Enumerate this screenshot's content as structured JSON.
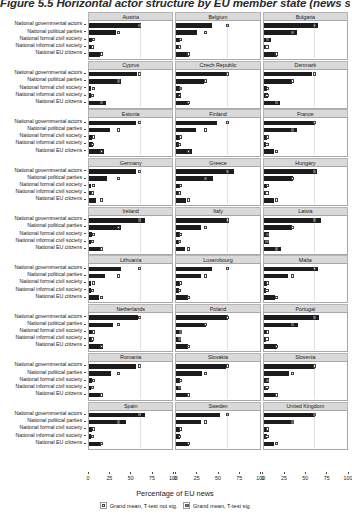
{
  "title": "Figure 5.5 Horizontal actor structure by EU member state (news stories)",
  "axis": {
    "xlabel": "Percentage of EU news",
    "xticks": [
      0,
      25,
      50,
      75,
      100
    ],
    "xlim": [
      0,
      100
    ],
    "categories": [
      "National governmental actors",
      "National political parties",
      "National formal civil society",
      "National informal civil society",
      "National EU citizens"
    ]
  },
  "legend": {
    "items": [
      {
        "label": "Grand mean, T-test not sig.",
        "marker": "open-square"
      },
      {
        "label": "Grand mean, T-test sig",
        "marker": "filled-square"
      }
    ]
  },
  "chart_data": {
    "type": "bar",
    "title": "Figure 5.5 Horizontal actor structure by EU member state (news stories)",
    "xlabel": "Percentage of EU news",
    "ylabel": "",
    "xlim": [
      0,
      100
    ],
    "grid": false,
    "legend_position": "bottom",
    "orientation": "horizontal",
    "categories": [
      "National governmental actors",
      "National political parties",
      "National formal civil society",
      "National informal civil society",
      "National EU citizens"
    ],
    "panels": [
      {
        "name": "Austria",
        "values": [
          63,
          33,
          4,
          3,
          13
        ],
        "grand_mean": [
          61,
          35,
          5,
          4,
          15
        ],
        "sig": [
          true,
          false,
          false,
          false,
          false
        ]
      },
      {
        "name": "Belgium",
        "values": [
          43,
          25,
          5,
          3,
          15
        ],
        "grand_mean": [
          61,
          35,
          5,
          4,
          15
        ],
        "sig": [
          false,
          false,
          false,
          false,
          false
        ]
      },
      {
        "name": "Bulgaria",
        "values": [
          65,
          40,
          9,
          3,
          16
        ],
        "grand_mean": [
          61,
          35,
          5,
          4,
          15
        ],
        "sig": [
          false,
          true,
          true,
          false,
          false
        ]
      },
      {
        "name": "Cyprus",
        "values": [
          58,
          38,
          3,
          2,
          20
        ],
        "grand_mean": [
          61,
          35,
          5,
          4,
          15
        ],
        "sig": [
          false,
          true,
          false,
          false,
          true
        ]
      },
      {
        "name": "Czech Republic",
        "values": [
          61,
          33,
          4,
          6,
          15
        ],
        "grand_mean": [
          61,
          35,
          5,
          4,
          15
        ],
        "sig": [
          false,
          false,
          true,
          false,
          false
        ]
      },
      {
        "name": "Denmark",
        "values": [
          58,
          34,
          4,
          5,
          20
        ],
        "grand_mean": [
          61,
          35,
          5,
          4,
          15
        ],
        "sig": [
          false,
          false,
          false,
          false,
          true
        ]
      },
      {
        "name": "Estonia",
        "values": [
          56,
          25,
          4,
          5,
          18
        ],
        "grand_mean": [
          61,
          35,
          5,
          4,
          15
        ],
        "sig": [
          false,
          false,
          false,
          false,
          false
        ]
      },
      {
        "name": "Finland",
        "values": [
          49,
          24,
          4,
          3,
          19
        ],
        "grand_mean": [
          61,
          35,
          5,
          4,
          15
        ],
        "sig": [
          false,
          false,
          false,
          false,
          false
        ]
      },
      {
        "name": "France",
        "values": [
          62,
          40,
          4,
          3,
          12
        ],
        "grand_mean": [
          61,
          35,
          5,
          4,
          15
        ],
        "sig": [
          false,
          true,
          false,
          false,
          false
        ]
      },
      {
        "name": "Germany",
        "values": [
          56,
          22,
          3,
          3,
          9
        ],
        "grand_mean": [
          61,
          35,
          5,
          4,
          15
        ],
        "sig": [
          false,
          false,
          false,
          false,
          false
        ]
      },
      {
        "name": "Greece",
        "values": [
          69,
          44,
          4,
          3,
          12
        ],
        "grand_mean": [
          61,
          35,
          5,
          4,
          15
        ],
        "sig": [
          true,
          true,
          false,
          false,
          false
        ]
      },
      {
        "name": "Hungary",
        "values": [
          64,
          35,
          4,
          3,
          13
        ],
        "grand_mean": [
          61,
          35,
          5,
          4,
          15
        ],
        "sig": [
          true,
          false,
          false,
          false,
          false
        ]
      },
      {
        "name": "Ireland",
        "values": [
          67,
          38,
          4,
          3,
          13
        ],
        "grand_mean": [
          61,
          35,
          5,
          4,
          15
        ],
        "sig": [
          true,
          false,
          false,
          false,
          false
        ]
      },
      {
        "name": "Italy",
        "values": [
          63,
          30,
          4,
          3,
          10
        ],
        "grand_mean": [
          61,
          35,
          5,
          4,
          15
        ],
        "sig": [
          false,
          false,
          false,
          false,
          false
        ]
      },
      {
        "name": "Latvia",
        "values": [
          69,
          34,
          7,
          6,
          21
        ],
        "grand_mean": [
          61,
          35,
          5,
          4,
          15
        ],
        "sig": [
          true,
          false,
          true,
          true,
          true
        ]
      },
      {
        "name": "Lithuania",
        "values": [
          38,
          19,
          3,
          2,
          12
        ],
        "grand_mean": [
          61,
          35,
          5,
          4,
          15
        ],
        "sig": [
          false,
          false,
          false,
          false,
          false
        ]
      },
      {
        "name": "Luxembourg",
        "values": [
          43,
          30,
          4,
          3,
          14
        ],
        "grand_mean": [
          61,
          35,
          5,
          4,
          15
        ],
        "sig": [
          false,
          false,
          false,
          false,
          false
        ]
      },
      {
        "name": "Malta",
        "values": [
          65,
          29,
          4,
          3,
          14
        ],
        "grand_mean": [
          61,
          35,
          5,
          4,
          15
        ],
        "sig": [
          false,
          false,
          false,
          false,
          false
        ]
      },
      {
        "name": "Netherlands",
        "values": [
          59,
          29,
          4,
          5,
          17
        ],
        "grand_mean": [
          61,
          35,
          5,
          4,
          15
        ],
        "sig": [
          false,
          false,
          false,
          false,
          false
        ]
      },
      {
        "name": "Poland",
        "values": [
          62,
          36,
          6,
          6,
          14
        ],
        "grand_mean": [
          61,
          35,
          5,
          4,
          15
        ],
        "sig": [
          false,
          false,
          true,
          true,
          false
        ]
      },
      {
        "name": "Portugal",
        "values": [
          67,
          41,
          5,
          3,
          16
        ],
        "grand_mean": [
          61,
          35,
          5,
          4,
          15
        ],
        "sig": [
          true,
          true,
          false,
          false,
          false
        ]
      },
      {
        "name": "Romania",
        "values": [
          56,
          27,
          4,
          3,
          16
        ],
        "grand_mean": [
          61,
          35,
          5,
          4,
          15
        ],
        "sig": [
          false,
          false,
          false,
          false,
          false
        ]
      },
      {
        "name": "Slovakia",
        "values": [
          60,
          31,
          5,
          6,
          16
        ],
        "grand_mean": [
          61,
          35,
          5,
          4,
          15
        ],
        "sig": [
          false,
          false,
          false,
          true,
          false
        ]
      },
      {
        "name": "Slovenia",
        "values": [
          62,
          31,
          6,
          5,
          16
        ],
        "grand_mean": [
          61,
          35,
          5,
          4,
          15
        ],
        "sig": [
          false,
          false,
          true,
          false,
          false
        ]
      },
      {
        "name": "Spain",
        "values": [
          67,
          44,
          4,
          3,
          14
        ],
        "grand_mean": [
          61,
          35,
          5,
          4,
          15
        ],
        "sig": [
          true,
          true,
          false,
          false,
          false
        ]
      },
      {
        "name": "Sweden",
        "values": [
          53,
          30,
          4,
          4,
          15
        ],
        "grand_mean": [
          61,
          35,
          5,
          4,
          15
        ],
        "sig": [
          false,
          false,
          false,
          false,
          false
        ]
      },
      {
        "name": "United Kingdom",
        "values": [
          62,
          37,
          6,
          4,
          13
        ],
        "grand_mean": [
          61,
          35,
          5,
          4,
          15
        ],
        "sig": [
          true,
          true,
          false,
          false,
          false
        ]
      }
    ]
  }
}
